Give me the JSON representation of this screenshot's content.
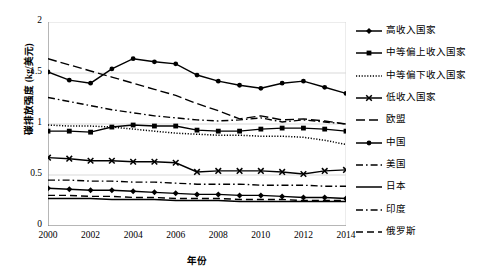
{
  "chart_data": {
    "type": "line",
    "title": "",
    "xlabel": "年份",
    "ylabel": "碳排放强度 (kg/美元)",
    "xlim": [
      2000,
      2014
    ],
    "ylim": [
      0,
      2
    ],
    "yticks": [
      "0",
      "0.5",
      "1",
      "1.5",
      "2"
    ],
    "ytick_values": [
      0,
      0.5,
      1,
      1.5,
      2
    ],
    "xticks": [
      "2000",
      "2002",
      "2004",
      "2006",
      "2008",
      "2010",
      "2012",
      "2014"
    ],
    "xtick_values": [
      2000,
      2002,
      2004,
      2006,
      2008,
      2010,
      2012,
      2014
    ],
    "x": [
      2000,
      2001,
      2002,
      2003,
      2004,
      2005,
      2006,
      2007,
      2008,
      2009,
      2010,
      2011,
      2012,
      2013,
      2014
    ],
    "grid": "horizontal",
    "legend_position": "right",
    "series": [
      {
        "name": "高收入国家",
        "marker": "diamond",
        "line": "solid",
        "color": "#000000",
        "values": [
          0.37,
          0.36,
          0.35,
          0.35,
          0.34,
          0.33,
          0.32,
          0.31,
          0.31,
          0.3,
          0.3,
          0.29,
          0.28,
          0.28,
          0.27
        ]
      },
      {
        "name": "中等偏上收入国家",
        "marker": "square",
        "line": "solid",
        "color": "#000000",
        "values": [
          0.93,
          0.93,
          0.92,
          0.97,
          0.99,
          0.98,
          0.98,
          0.94,
          0.93,
          0.93,
          0.95,
          0.96,
          0.96,
          0.95,
          0.93
        ]
      },
      {
        "name": "中等偏下收入国家",
        "marker": "none",
        "line": "dotted",
        "color": "#000000",
        "values": [
          0.99,
          0.98,
          0.98,
          0.97,
          0.95,
          0.93,
          0.91,
          0.9,
          0.89,
          0.89,
          0.88,
          0.88,
          0.87,
          0.84,
          0.8
        ]
      },
      {
        "name": "低收入国家",
        "marker": "cross",
        "line": "solid",
        "color": "#000000",
        "values": [
          0.67,
          0.66,
          0.64,
          0.64,
          0.63,
          0.63,
          0.62,
          0.53,
          0.54,
          0.54,
          0.54,
          0.53,
          0.51,
          0.54,
          0.55
        ]
      },
      {
        "name": "欧盟",
        "marker": "none",
        "line": "dashed",
        "color": "#000000",
        "values": [
          1.64,
          1.58,
          1.52,
          1.46,
          1.4,
          1.34,
          1.28,
          1.2,
          1.13,
          1.05,
          1.08,
          1.04,
          1.05,
          1.03,
          1.0
        ]
      },
      {
        "name": "中国",
        "marker": "circle",
        "line": "solid",
        "color": "#000000",
        "values": [
          1.51,
          1.43,
          1.4,
          1.54,
          1.64,
          1.61,
          1.59,
          1.48,
          1.42,
          1.38,
          1.35,
          1.4,
          1.42,
          1.36,
          1.3
        ]
      },
      {
        "name": "美国",
        "marker": "none",
        "line": "dashdot",
        "color": "#000000",
        "values": [
          1.26,
          1.22,
          1.18,
          1.14,
          1.11,
          1.08,
          1.06,
          1.04,
          1.03,
          1.04,
          1.06,
          1.02,
          1.04,
          1.02,
          1.0
        ]
      },
      {
        "name": "日本",
        "marker": "none",
        "line": "solid",
        "color": "#000000",
        "values": [
          0.27,
          0.27,
          0.27,
          0.26,
          0.26,
          0.26,
          0.25,
          0.25,
          0.25,
          0.24,
          0.24,
          0.24,
          0.24,
          0.24,
          0.24
        ]
      },
      {
        "name": "印度",
        "marker": "none",
        "line": "dashdot",
        "color": "#000000",
        "values": [
          0.45,
          0.45,
          0.44,
          0.44,
          0.43,
          0.43,
          0.42,
          0.41,
          0.41,
          0.41,
          0.4,
          0.4,
          0.4,
          0.39,
          0.39
        ]
      },
      {
        "name": "俄罗斯",
        "marker": "none",
        "line": "dashed-long",
        "color": "#000000",
        "values": [
          0.3,
          0.3,
          0.29,
          0.29,
          0.28,
          0.28,
          0.27,
          0.27,
          0.27,
          0.26,
          0.26,
          0.26,
          0.25,
          0.25,
          0.25
        ]
      },
      {
        "name": "高收入国家线 (三角)",
        "marker": "triangle",
        "line": "solid",
        "color": "#000000",
        "values": [
          0.37,
          0.36,
          0.35,
          0.35,
          0.34,
          0.33,
          0.32,
          0.31,
          0.31,
          0.3,
          0.3,
          0.29,
          0.28,
          0.28,
          0.27
        ],
        "hidden": true
      }
    ]
  }
}
